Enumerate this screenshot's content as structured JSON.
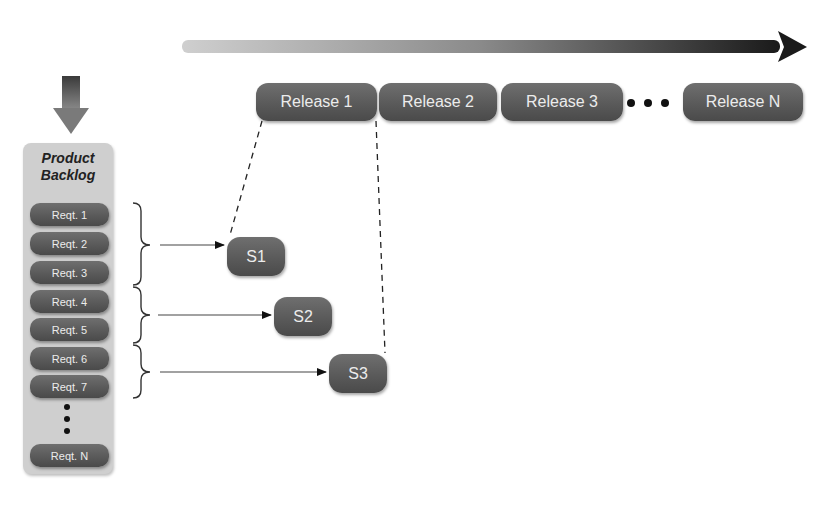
{
  "timeline": {
    "direction_arrow": "right-arrow",
    "releases": [
      {
        "label": "Release 1",
        "x": 256,
        "w": 121
      },
      {
        "label": "Release 2",
        "x": 379,
        "w": 118
      },
      {
        "label": "Release 3",
        "x": 501,
        "w": 122
      },
      {
        "label": "Release N",
        "x": 683,
        "w": 120
      }
    ],
    "ellipsis": "..."
  },
  "backlog": {
    "title_line1": "Product",
    "title_line2": "Backlog",
    "input_arrow": "down-arrow",
    "items": [
      {
        "label": "Reqt. 1",
        "y": 203
      },
      {
        "label": "Reqt. 2",
        "y": 232
      },
      {
        "label": "Reqt. 3",
        "y": 261
      },
      {
        "label": "Reqt. 4",
        "y": 290
      },
      {
        "label": "Reqt. 5",
        "y": 318
      },
      {
        "label": "Reqt. 6",
        "y": 347
      },
      {
        "label": "Reqt. 7",
        "y": 375
      },
      {
        "label": "Reqt. N",
        "y": 444
      }
    ]
  },
  "sprints": [
    {
      "label": "S1",
      "x": 227,
      "y": 237,
      "groups": [
        "Reqt. 1",
        "Reqt. 2",
        "Reqt. 3"
      ]
    },
    {
      "label": "S2",
      "x": 274,
      "y": 297,
      "groups": [
        "Reqt. 4",
        "Reqt. 5"
      ]
    },
    {
      "label": "S3",
      "x": 329,
      "y": 354,
      "groups": [
        "Reqt. 6",
        "Reqt. 7"
      ]
    }
  ],
  "colors": {
    "pill": "#5a5a5a",
    "pill_text": "#ececec",
    "backlog_bg": "#cfcfcf",
    "arrow_dark": "#1a1a1a",
    "arrow_light": "#c8c8c8"
  }
}
